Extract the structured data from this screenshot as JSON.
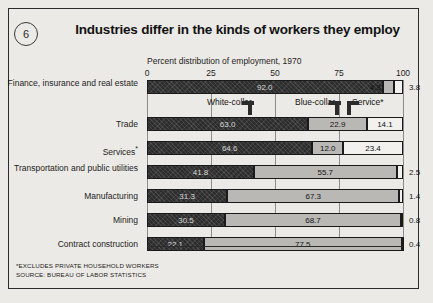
{
  "figure": {
    "number": "6",
    "title": "Industries differ in the kinds of workers they employ"
  },
  "notes": {
    "footnote": "*EXCLUDES PRIVATE HOUSEHOLD WORKERS",
    "source": "SOURCE: BUREAU OF LABOR STATISTICS"
  },
  "legend": {
    "white_collar": "White-collar",
    "blue_collar": "Blue-collar",
    "service": "Service*"
  },
  "chart_data": {
    "type": "bar",
    "orientation": "horizontal",
    "stacked": true,
    "title": "Industries differ in the kinds of workers they employ",
    "xlabel": "Percent distribution of employment, 1970",
    "ylabel": "",
    "xlim": [
      0,
      100
    ],
    "xticks": [
      "0",
      "25",
      "50",
      "75",
      "100"
    ],
    "xtick_values": [
      0,
      25,
      50,
      75,
      100
    ],
    "grid": true,
    "legend_position": "top-inline",
    "categories": [
      "Finance, insurance and real estate",
      "Trade",
      "Services*",
      "Transportation and public utilities",
      "Manufacturing",
      "Mining",
      "Contract construction"
    ],
    "series": [
      {
        "name": "White-collar",
        "values": [
          92.0,
          63.0,
          64.6,
          41.8,
          31.3,
          30.5,
          22.1
        ]
      },
      {
        "name": "Blue-collar",
        "values": [
          4.3,
          22.9,
          12.0,
          55.7,
          67.3,
          68.7,
          77.5
        ]
      },
      {
        "name": "Service*",
        "values": [
          3.8,
          14.1,
          23.4,
          2.5,
          1.4,
          0.8,
          0.4
        ]
      }
    ],
    "labels": {
      "white_collar": [
        "92.0",
        "63.0",
        "64.6",
        "41.8",
        "31.3",
        "30.5",
        "22.1"
      ],
      "blue_collar": [
        "4.3",
        "22.9",
        "12.0",
        "55.7",
        "67.3",
        "68.7",
        "77.5"
      ],
      "service": [
        "3.8",
        "14.1",
        "23.4",
        "2.5",
        "1.4",
        "0.8",
        "0.4"
      ]
    },
    "service_label_outside": [
      true,
      false,
      false,
      true,
      true,
      true,
      true
    ]
  },
  "colors": {
    "white_collar": "#2d2d2d",
    "blue_collar": "#b9b8b4",
    "service": "#f2f1ee",
    "frame": "#2b2b2b",
    "background": "#eceae6"
  }
}
